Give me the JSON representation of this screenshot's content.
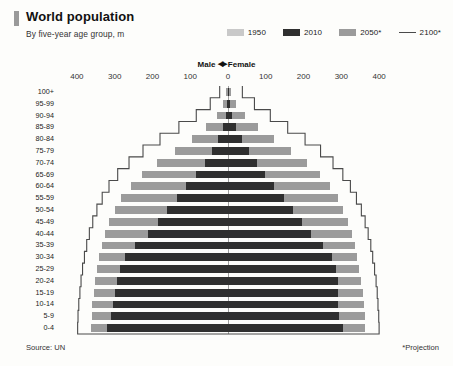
{
  "header": {
    "title": "World population",
    "subtitle": "By five-year age group, m",
    "accent_color": "#9a9a9a"
  },
  "legend": {
    "items": [
      {
        "label": "1950",
        "type": "swatch",
        "color": "#c9c9c9"
      },
      {
        "label": "2010",
        "type": "swatch",
        "color": "#2f2f2f"
      },
      {
        "label": "2050*",
        "type": "swatch",
        "color": "#9b9b9b"
      },
      {
        "label": "2100*",
        "type": "line",
        "color": "#4a4a4a"
      }
    ]
  },
  "axis_header": {
    "male_label": "Male",
    "female_label": "Female",
    "left_arrow": "◀",
    "right_arrow": "▶"
  },
  "footer": {
    "source": "Source: UN",
    "projection_note": "*Projection"
  },
  "chart_data": {
    "type": "bar",
    "subtype": "population-pyramid",
    "title": "World population",
    "subtitle": "By five-year age group, m",
    "xlabel": "",
    "ylabel": "",
    "unit": "millions",
    "xlim": [
      -450,
      450
    ],
    "xticks": [
      -400,
      -300,
      -200,
      -100,
      0,
      100,
      200,
      300,
      400
    ],
    "xtick_labels": [
      "400",
      "300",
      "200",
      "100",
      "0",
      "100",
      "200",
      "300",
      "400"
    ],
    "grid": false,
    "legend_position": "top-right",
    "left_side": "Male",
    "right_side": "Female",
    "categories": [
      "100+",
      "95-99",
      "90-94",
      "85-89",
      "80-84",
      "75-79",
      "70-74",
      "65-69",
      "60-64",
      "55-59",
      "50-54",
      "45-49",
      "40-44",
      "35-39",
      "30-34",
      "25-29",
      "20-24",
      "15-19",
      "10-14",
      "5-9",
      "0-4"
    ],
    "series": [
      {
        "name": "1950",
        "color": "#c9c9c9",
        "male": [
          0,
          0,
          1,
          3,
          7,
          13,
          22,
          33,
          46,
          58,
          69,
          80,
          91,
          103,
          116,
          131,
          147,
          163,
          178,
          190,
          200
        ],
        "female": [
          0,
          1,
          2,
          4,
          9,
          16,
          26,
          38,
          51,
          63,
          74,
          84,
          94,
          105,
          118,
          132,
          147,
          162,
          176,
          187,
          196
        ]
      },
      {
        "name": "2010",
        "color": "#2f2f2f",
        "male": [
          1,
          2,
          6,
          14,
          26,
          42,
          62,
          85,
          110,
          136,
          161,
          186,
          212,
          247,
          272,
          287,
          295,
          300,
          305,
          310,
          320
        ],
        "female": [
          2,
          4,
          11,
          22,
          37,
          55,
          76,
          99,
          123,
          148,
          172,
          196,
          220,
          252,
          274,
          287,
          292,
          290,
          290,
          295,
          305
        ]
      },
      {
        "name": "2050*",
        "color": "#9b9b9b",
        "male": [
          4,
          12,
          29,
          57,
          96,
          141,
          187,
          227,
          258,
          282,
          300,
          314,
          325,
          334,
          341,
          347,
          352,
          356,
          359,
          361,
          362
        ],
        "female": [
          9,
          22,
          46,
          80,
          122,
          167,
          209,
          244,
          270,
          290,
          305,
          317,
          327,
          335,
          342,
          348,
          353,
          357,
          360,
          362,
          363
        ]
      },
      {
        "name": "2100*",
        "color": "#4a4a4a",
        "style": "outline",
        "male": [
          22,
          47,
          84,
          130,
          180,
          225,
          262,
          292,
          315,
          333,
          347,
          358,
          367,
          374,
          380,
          385,
          389,
          392,
          395,
          397,
          398
        ],
        "female": [
          38,
          70,
          112,
          158,
          204,
          245,
          278,
          304,
          324,
          340,
          353,
          363,
          371,
          378,
          383,
          388,
          392,
          395,
          397,
          399,
          400
        ]
      }
    ]
  }
}
